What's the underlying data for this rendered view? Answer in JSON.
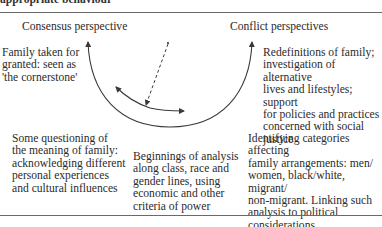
{
  "page": {
    "cut_off_heading": "appropriate behaviour"
  },
  "diagram": {
    "headings": {
      "left": "Consensus perspective",
      "right": "Conflict perspectives"
    },
    "boxes": {
      "top_left": "Family taken for\ngranted: seen as\n'the cornerstone'",
      "top_right": "Redefinitions of family;\ninvestigation of alternative\nlives and lifestyles; support\nfor policies and practices\nconcerned with social\njustice",
      "bottom_left": "Some questioning of\nthe meaning of family:\nacknowledging different\npersonal experiences\nand cultural influences",
      "bottom_middle": "Beginnings of analysis\nalong class, race and\ngender lines, using\neconomic and other\ncriteria of power",
      "bottom_right": "Identifying categories affecting\nfamily arrangements: men/\nwomen, black/white, migrant/\nnon-migrant. Linking such\nanalysis to political\nconsiderations"
    },
    "arrows": [
      {
        "name": "outer-arc",
        "style": "solid",
        "heads": "both-ends-upward"
      },
      {
        "name": "inner-arc",
        "style": "solid",
        "heads": "both-ends"
      },
      {
        "name": "dashed-pointer",
        "style": "dashed",
        "heads": "end-on-inner-arc"
      }
    ],
    "colors": {
      "text": "#2b2b2b",
      "lines": "#3a3a3a",
      "rule": "#6a6a6a"
    }
  }
}
